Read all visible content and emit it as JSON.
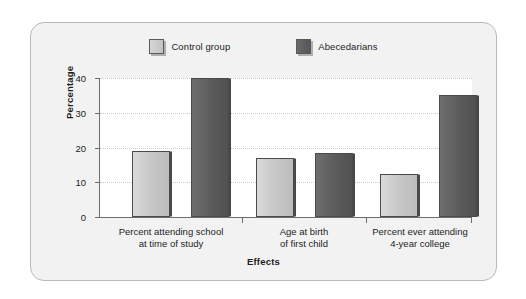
{
  "chart_data": {
    "type": "bar",
    "title": "",
    "xlabel": "Effects",
    "ylabel": "Percentage",
    "categories": [
      "Percent attending school\nat time of study",
      "Age at birth\nof first child",
      "Percent ever attending\n4-year college"
    ],
    "category_lines": [
      [
        "Percent attending school",
        "at time of study"
      ],
      [
        "Age at birth",
        "of first child"
      ],
      [
        "Percent ever attending",
        "4-year college"
      ]
    ],
    "series": [
      {
        "name": "Control group",
        "values": [
          19,
          17,
          12.5
        ],
        "color": "#c6c6c6"
      },
      {
        "name": "Abecedarians",
        "values": [
          40,
          18.3,
          35
        ],
        "color": "#5b5b5b"
      }
    ],
    "ylim": [
      0,
      40
    ],
    "yticks": [
      0,
      10,
      20,
      30,
      40
    ],
    "ytick_labels": [
      "0",
      "10",
      "20",
      "30",
      "40"
    ],
    "grid": true,
    "legend_position": "top-center"
  },
  "legend": {
    "entries": [
      {
        "label": "Control group",
        "swatch": "light-gray-square"
      },
      {
        "label": "Abecedarians",
        "swatch": "dark-gray-square"
      }
    ]
  },
  "axes": {
    "y_title": "Percentage",
    "x_title": "Effects",
    "y_tick_0": "0",
    "y_tick_1": "10",
    "y_tick_2": "20",
    "y_tick_3": "30",
    "y_tick_4": "40"
  },
  "colors": {
    "control_group": "#c6c6c6",
    "abecedarians": "#5b5b5b",
    "card_background": "#f2f2f2",
    "card_border": "#b9b9b9",
    "plot_background": "#ffffff",
    "axis": "#6d6d6d",
    "gridline": "#c9c9c9",
    "text": "#1d1d1d"
  }
}
